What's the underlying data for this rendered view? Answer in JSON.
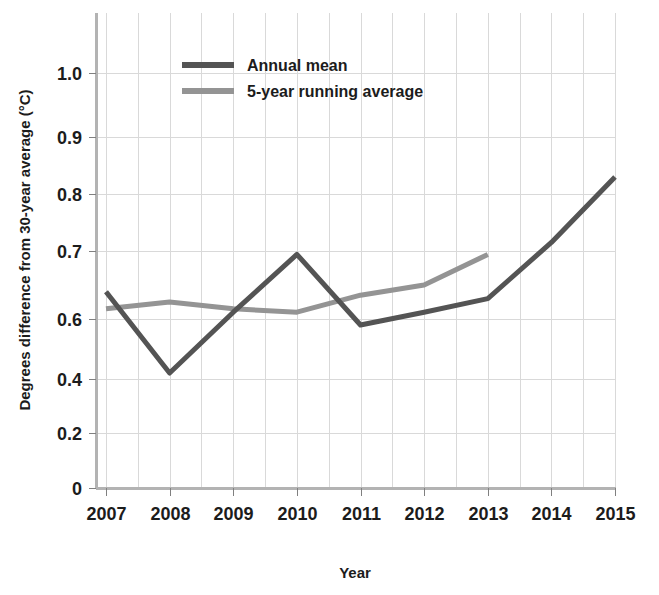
{
  "chart_data": {
    "type": "line",
    "title": "",
    "xlabel": "Year",
    "ylabel": "Degrees difference from 30-year average (°C)",
    "x": [
      2007,
      2008,
      2009,
      2010,
      2011,
      2012,
      2013,
      2014,
      2015
    ],
    "xtick_labels": [
      "2007",
      "2008",
      "2009",
      "2010",
      "2011",
      "2012",
      "2013",
      "2014",
      "2015"
    ],
    "ytick_labels": [
      "0",
      "0.2",
      "0.4",
      "0.6",
      "0.7",
      "0.8",
      "0.9",
      "1.0"
    ],
    "ytick_values": [
      0,
      0.2,
      0.4,
      0.6,
      0.7,
      0.8,
      0.9,
      1.0
    ],
    "ylim": [
      0,
      1.05
    ],
    "xlim": [
      2007,
      2015
    ],
    "y_axis_broken": true,
    "grid": true,
    "grid_x_interval_years": 0.5,
    "legend_position": "top-center",
    "series": [
      {
        "name": "Annual mean",
        "color": "#545454",
        "x": [
          2007,
          2008,
          2009,
          2010,
          2011,
          2012,
          2013,
          2014,
          2015
        ],
        "values": [
          0.64,
          0.42,
          0.61,
          0.695,
          0.58,
          0.61,
          0.63,
          0.715,
          0.83
        ]
      },
      {
        "name": "5-year running average",
        "color": "#949494",
        "x": [
          2007,
          2008,
          2009,
          2010,
          2011,
          2012,
          2013
        ],
        "values": [
          0.615,
          0.625,
          0.615,
          0.61,
          0.635,
          0.65,
          0.695
        ]
      }
    ]
  },
  "legend": {
    "items": [
      {
        "label": "Annual mean",
        "color": "#545454"
      },
      {
        "label": "5-year running average",
        "color": "#949494"
      }
    ]
  },
  "colors": {
    "annual_mean": "#545454",
    "running_average": "#949494",
    "grid": "#d9d9d9",
    "axis": "#b3b3b3",
    "text": "#1c1c1c",
    "background": "#ffffff"
  }
}
